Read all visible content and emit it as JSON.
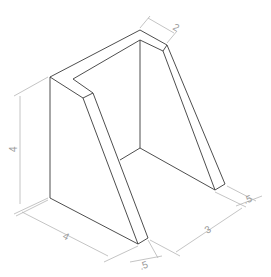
{
  "drawing": {
    "type": "isometric-technical-drawing",
    "subject": "support bracket with angled sides and open center",
    "line_color": "#3a3a3a",
    "dimension_color": "#b5b5b5"
  },
  "dimensions": {
    "top_thickness": "2",
    "height": "4",
    "base_depth": "4",
    "inner_width": "3",
    "front_thickness": ".5",
    "right_thickness": ".5"
  }
}
